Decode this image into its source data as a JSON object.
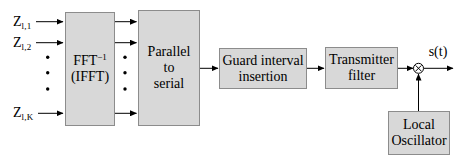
{
  "diagram": {
    "inputs": [
      {
        "main": "Z",
        "sub": "l,1"
      },
      {
        "main": "Z",
        "sub": "l,2"
      },
      {
        "main": "Z",
        "sub": "l,K"
      }
    ],
    "blocks": {
      "ifft": {
        "title": "FFT",
        "sup": "−1",
        "line2": "(IFFT)"
      },
      "p2s": {
        "line1": "Parallel",
        "line2": "to",
        "line3": "serial"
      },
      "guard": {
        "line1": "Guard interval",
        "line2": "insertion"
      },
      "tx": {
        "line1": "Transmitter",
        "line2": "filter"
      },
      "lo": {
        "line1": "Local",
        "line2": "Oscillator"
      }
    },
    "output_label": "s(t)",
    "multiplier_symbol": "⊗",
    "colors": {
      "block_fill": "#d8d8d8",
      "block_border": "#8c8c8c",
      "line": "#000000",
      "background": "#ffffff"
    }
  }
}
